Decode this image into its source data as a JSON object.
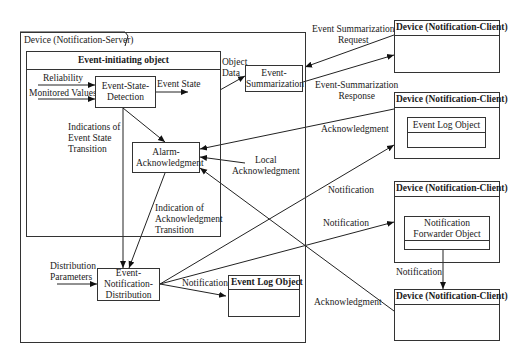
{
  "server": {
    "title": "Device (Notification-Server)",
    "initiating_object": {
      "title": "Event-initiating object",
      "inputs": {
        "reliability": "Reliability",
        "monitored_values": "Monitored Values"
      },
      "esd": "Event-State-Detection",
      "event_state": "Event State",
      "indications": [
        "Indications of",
        "Event State",
        "Transition"
      ],
      "alarm_ack": "Alarm-Acknowledgment",
      "ack_transition": [
        "Indication of",
        "Acknowledgment",
        "Transition"
      ]
    },
    "object_data": [
      "Object",
      "Data"
    ],
    "event_summarization": "Event-Summarization",
    "local_ack": [
      "Local",
      "Acknowledgment"
    ],
    "distribution_params": [
      "Distribution",
      "Parameters"
    ],
    "end": "Event-Notification-Distribution",
    "notification_label": "Notification",
    "event_log_object": "Event Log Object"
  },
  "links": {
    "es_request": [
      "Event Summarization",
      "Request"
    ],
    "es_response": [
      "Event-Summarization",
      "Response"
    ],
    "acknowledgment_1": "Acknowledgment",
    "notification_1": "Notification",
    "notification_2": "Notification",
    "notification_fwd": "Notification",
    "acknowledgment_2": "Acknowledgment"
  },
  "clients": [
    {
      "title": "Device (Notification-Client)"
    },
    {
      "title": "Device (Notification-Client)",
      "inner": "Event Log Object"
    },
    {
      "title": "Device (Notification-Client)",
      "inner": "Notification Forwarder Object"
    },
    {
      "title": "Device (Notification-Client)"
    }
  ]
}
